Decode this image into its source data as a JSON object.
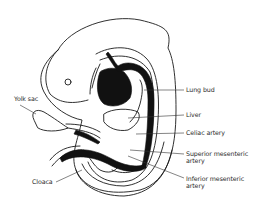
{
  "diagram": {
    "colors": {
      "line": "#1a1a1a",
      "fill": "#111111",
      "background": "#ffffff"
    },
    "labels": [
      {
        "id": "lung-bud",
        "text": "Lung bud",
        "side": "right"
      },
      {
        "id": "liver",
        "text": "Liver",
        "side": "right"
      },
      {
        "id": "celiac-artery",
        "text": "Celiac artery",
        "side": "right"
      },
      {
        "id": "superior-mesenteric-artery",
        "line1": "Superior mesenteric",
        "line2": "artery",
        "side": "right"
      },
      {
        "id": "inferior-mesenteric-artery",
        "line1": "Inferior mesenteric",
        "line2": "artery",
        "side": "right"
      },
      {
        "id": "yolk-sac",
        "text": "Yolk sac",
        "side": "left"
      },
      {
        "id": "cloaca",
        "text": "Cloaca",
        "side": "left"
      }
    ]
  }
}
